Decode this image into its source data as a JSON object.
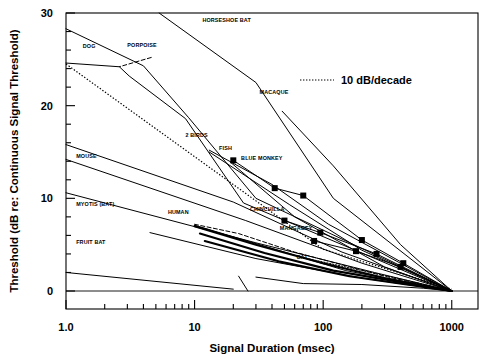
{
  "chart_data": {
    "type": "line",
    "title": "",
    "xlabel": "Signal Duration (msec)",
    "ylabel": "Threshold (dB re: Continuous Signal Threshold)",
    "xscale": "log",
    "xlim": [
      1.0,
      1600
    ],
    "ylim": [
      -1.5,
      30
    ],
    "xticks": [
      1.0,
      10,
      100,
      1000
    ],
    "xticklabels": [
      "1.0",
      "10",
      "100",
      "1000"
    ],
    "yticks": [
      0,
      10,
      20,
      30
    ],
    "yticklabels": [
      "0",
      "10",
      "20",
      "30"
    ],
    "yminortickstep": 2,
    "grid": false,
    "legend": {
      "position": "upper-right-inside",
      "entries": [
        {
          "label": "10 dB/decade",
          "style": "dotted"
        }
      ]
    },
    "reference_line": {
      "label": "10 dB/decade",
      "style": "dotted",
      "points": [
        [
          1.0,
          24.5
        ],
        [
          100,
          4.5
        ],
        [
          1000,
          0.2
        ]
      ]
    },
    "series": [
      {
        "name": "HORSESHOE BAT",
        "label": "HORSESHOE BAT",
        "label_pos": [
          11.5,
          29.0
        ],
        "style": "solid",
        "markers": false,
        "points": [
          [
            5.3,
            30.0
          ],
          [
            30,
            22.5
          ],
          [
            120,
            10.0
          ],
          [
            1000,
            0.0
          ]
        ]
      },
      {
        "name": "DOG",
        "label": "DOG",
        "label_pos": [
          1.35,
          26.2
        ],
        "style": "solid",
        "markers": false,
        "points": [
          [
            1.0,
            28.3
          ],
          [
            4.0,
            24.3
          ],
          [
            9.0,
            18.7
          ],
          [
            30,
            10.0
          ],
          [
            1000,
            0.0
          ]
        ]
      },
      {
        "name": "PORPOISE",
        "label": "PORPOISE",
        "label_pos": [
          3.0,
          26.3
        ],
        "style": "dashed",
        "markers": false,
        "points": [
          [
            4.6,
            25.2
          ],
          [
            2.6,
            24.2
          ]
        ]
      },
      {
        "name": "PORPOISE-CURVE",
        "label": "",
        "label_pos": null,
        "style": "solid",
        "markers": false,
        "points": [
          [
            1.0,
            24.6
          ],
          [
            2.6,
            24.2
          ],
          [
            3.1,
            23.2
          ],
          [
            8.5,
            18.6
          ],
          [
            24,
            9.5
          ],
          [
            1000,
            0.0
          ]
        ]
      },
      {
        "name": "MACAQUE",
        "label": "MACAQUE",
        "label_pos": [
          32,
          21.3
        ],
        "style": "solid",
        "markers": false,
        "points": [
          [
            48,
            19.4
          ],
          [
            120,
            13.5
          ],
          [
            400,
            5.0
          ],
          [
            1000,
            0.0
          ]
        ]
      },
      {
        "name": "2 BIRDS",
        "label": "2 BIRDS",
        "label_pos": [
          8.5,
          16.6
        ],
        "style": "solid",
        "markers": false,
        "points": [
          [
            13,
            15.2
          ],
          [
            40,
            11.5
          ],
          [
            110,
            7.2
          ],
          [
            1000,
            0.0
          ]
        ]
      },
      {
        "name": "2 BIRDS B",
        "label": "",
        "label_pos": null,
        "style": "solid",
        "markers": false,
        "points": [
          [
            13,
            15.0
          ],
          [
            55,
            9.3
          ],
          [
            200,
            4.4
          ],
          [
            1000,
            0.0
          ]
        ]
      },
      {
        "name": "MOUSE",
        "label": "MOUSE",
        "label_pos": [
          1.2,
          14.3
        ],
        "style": "solid",
        "markers": false,
        "points": [
          [
            1.0,
            15.8
          ],
          [
            20,
            9.6
          ],
          [
            140,
            4.2
          ],
          [
            1000,
            0.0
          ]
        ]
      },
      {
        "name": "MOUSE B",
        "label": "",
        "label_pos": null,
        "style": "solid",
        "markers": false,
        "points": [
          [
            1.0,
            14.2
          ],
          [
            25,
            7.6
          ],
          [
            200,
            3.0
          ],
          [
            1000,
            0.0
          ]
        ]
      },
      {
        "name": "FISH",
        "label": "FISH",
        "label_pos": [
          15.5,
          15.2
        ],
        "style": "solid",
        "markers": false,
        "points": [
          [
            19,
            13.9
          ],
          [
            60,
            8.0
          ],
          [
            300,
            2.6
          ],
          [
            1000,
            0.0
          ]
        ]
      },
      {
        "name": "BLUE MONKEY",
        "label": "BLUE MONKEY",
        "label_pos": [
          23,
          14.1
        ],
        "style": "solid",
        "markers": true,
        "points": [
          [
            20,
            14.1
          ],
          [
            42,
            11.1
          ],
          [
            70,
            10.3
          ],
          [
            200,
            5.5
          ],
          [
            420,
            3.0
          ],
          [
            1000,
            0.0
          ]
        ]
      },
      {
        "name": "MYOTIS (BAT)",
        "label": "MYOTIS (BAT)",
        "label_pos": [
          1.2,
          9.2
        ],
        "style": "solid",
        "markers": false,
        "points": [
          [
            1.0,
            10.6
          ],
          [
            30,
            5.2
          ],
          [
            250,
            2.0
          ],
          [
            1000,
            0.0
          ]
        ]
      },
      {
        "name": "HUMAN",
        "label": "HUMAN",
        "label_pos": [
          6.2,
          8.3
        ],
        "style": "dashed",
        "markers": false,
        "points": [
          [
            10,
            7.2
          ],
          [
            22,
            6.2
          ],
          [
            60,
            4.2
          ],
          [
            300,
            1.6
          ],
          [
            1000,
            0.0
          ]
        ]
      },
      {
        "name": "HUMAN B",
        "label": "",
        "label_pos": null,
        "style": "solid",
        "markers": false,
        "points": [
          [
            10,
            7.1
          ],
          [
            40,
            4.6
          ],
          [
            150,
            2.2
          ],
          [
            1000,
            0.0
          ]
        ]
      },
      {
        "name": "CHINCHILLA",
        "label": "CHINCHILLA",
        "label_pos": [
          27,
          8.6
        ],
        "style": "solid",
        "markers": true,
        "points": [
          [
            50,
            7.6
          ],
          [
            95,
            6.3
          ],
          [
            260,
            4.0
          ],
          [
            1000,
            0.0
          ]
        ]
      },
      {
        "name": "MANGABEY",
        "label": "MANGABEY",
        "label_pos": [
          46,
          6.6
        ],
        "style": "solid",
        "markers": true,
        "points": [
          [
            85,
            5.4
          ],
          [
            180,
            4.3
          ],
          [
            400,
            2.6
          ],
          [
            1000,
            0.0
          ]
        ]
      },
      {
        "name": "CAT",
        "label": "CAT",
        "label_pos": [
          62,
          3.4
        ],
        "style": "dotted",
        "markers": false,
        "points": [
          [
            70,
            3.6
          ],
          [
            160,
            2.5
          ],
          [
            400,
            1.3
          ],
          [
            1000,
            0.0
          ]
        ]
      },
      {
        "name": "FRUIT BAT",
        "label": "FRUIT BAT",
        "label_pos": [
          1.2,
          5.1
        ],
        "style": "solid",
        "markers": false,
        "points": [
          [
            4.5,
            6.3
          ],
          [
            30,
            3.5
          ],
          [
            200,
            1.4
          ],
          [
            1000,
            0.0
          ]
        ]
      },
      {
        "name": "HEAVY A",
        "label": "",
        "label_pos": null,
        "style": "solid-thick",
        "markers": false,
        "points": [
          [
            10,
            7.0
          ],
          [
            30,
            5.0
          ],
          [
            100,
            3.0
          ],
          [
            300,
            1.4
          ],
          [
            1000,
            0.0
          ]
        ]
      },
      {
        "name": "HEAVY B",
        "label": "",
        "label_pos": null,
        "style": "solid-thick",
        "markers": false,
        "points": [
          [
            11,
            6.2
          ],
          [
            35,
            4.1
          ],
          [
            120,
            2.2
          ],
          [
            1000,
            0.0
          ]
        ]
      },
      {
        "name": "HEAVY C",
        "label": "",
        "label_pos": null,
        "style": "solid-thick",
        "markers": false,
        "points": [
          [
            12,
            5.4
          ],
          [
            45,
            3.2
          ],
          [
            160,
            1.6
          ],
          [
            1000,
            0.0
          ]
        ]
      },
      {
        "name": "EXTRA LOW",
        "label": "",
        "label_pos": null,
        "style": "solid",
        "markers": false,
        "points": [
          [
            1.0,
            2.0
          ],
          [
            20,
            0.2
          ]
        ]
      },
      {
        "name": "EXTRA LOW B",
        "label": "",
        "label_pos": null,
        "style": "solid",
        "markers": false,
        "points": [
          [
            22,
            1.6
          ],
          [
            26,
            0.0
          ]
        ]
      },
      {
        "name": "EXTRA FLAT",
        "label": "",
        "label_pos": null,
        "style": "solid",
        "markers": false,
        "points": [
          [
            30,
            1.5
          ],
          [
            70,
            0.8
          ],
          [
            200,
            0.7
          ],
          [
            600,
            0.3
          ],
          [
            1000,
            0.0
          ]
        ]
      }
    ]
  }
}
